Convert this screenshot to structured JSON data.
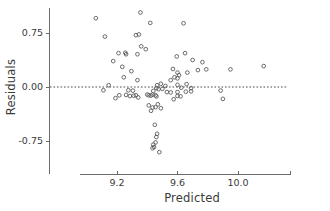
{
  "chart_data": {
    "type": "scatter",
    "title": "",
    "xlabel": "Predicted",
    "ylabel": "Residuals",
    "xlim": [
      9.02,
      10.32
    ],
    "ylim": [
      -1.02,
      1.02
    ],
    "xticks": [
      9.2,
      9.6,
      10.0
    ],
    "xticklabels": [
      "9.2",
      "9.6",
      "10.0"
    ],
    "yticks": [
      0.75,
      0.0,
      -0.75
    ],
    "yticklabels": [
      "0.75",
      "0.00",
      "-0.75"
    ],
    "grid": false,
    "legend": null,
    "reference_lines": [
      {
        "orientation": "horizontal",
        "y": 0.0,
        "style": "dotted"
      }
    ],
    "marker": "open-circle",
    "point_count": 84,
    "points": [
      {
        "x": 9.06,
        "y": 0.955
      },
      {
        "x": 9.12,
        "y": 0.7
      },
      {
        "x": 9.355,
        "y": 1.035
      },
      {
        "x": 9.42,
        "y": 0.89
      },
      {
        "x": 9.325,
        "y": 0.72
      },
      {
        "x": 9.345,
        "y": 0.73
      },
      {
        "x": 9.64,
        "y": 0.885
      },
      {
        "x": 9.36,
        "y": 0.565
      },
      {
        "x": 9.39,
        "y": 0.525
      },
      {
        "x": 9.21,
        "y": 0.47
      },
      {
        "x": 9.255,
        "y": 0.475
      },
      {
        "x": 9.26,
        "y": 0.455
      },
      {
        "x": 9.335,
        "y": 0.455
      },
      {
        "x": 9.595,
        "y": 0.425
      },
      {
        "x": 9.65,
        "y": 0.47
      },
      {
        "x": 9.175,
        "y": 0.36
      },
      {
        "x": 9.7,
        "y": 0.375
      },
      {
        "x": 9.765,
        "y": 0.345
      },
      {
        "x": 9.235,
        "y": 0.28
      },
      {
        "x": 9.295,
        "y": 0.22
      },
      {
        "x": 9.57,
        "y": 0.25
      },
      {
        "x": 9.6,
        "y": 0.2
      },
      {
        "x": 9.61,
        "y": 0.165
      },
      {
        "x": 9.665,
        "y": 0.2
      },
      {
        "x": 9.735,
        "y": 0.235
      },
      {
        "x": 9.79,
        "y": 0.245
      },
      {
        "x": 9.95,
        "y": 0.245
      },
      {
        "x": 10.17,
        "y": 0.29
      },
      {
        "x": 9.245,
        "y": 0.135
      },
      {
        "x": 9.335,
        "y": 0.095
      },
      {
        "x": 9.555,
        "y": 0.095
      },
      {
        "x": 9.58,
        "y": 0.135
      },
      {
        "x": 9.6,
        "y": 0.12
      },
      {
        "x": 9.145,
        "y": 0.025
      },
      {
        "x": 9.465,
        "y": 0.025
      },
      {
        "x": 9.49,
        "y": 0.045
      },
      {
        "x": 9.52,
        "y": 0.015
      },
      {
        "x": 9.6,
        "y": 0.03
      },
      {
        "x": 9.66,
        "y": 0.04
      },
      {
        "x": 9.46,
        "y": -0.015
      },
      {
        "x": 9.475,
        "y": -0.03
      },
      {
        "x": 9.5,
        "y": -0.025
      },
      {
        "x": 9.625,
        "y": -0.01
      },
      {
        "x": 9.69,
        "y": -0.015
      },
      {
        "x": 9.11,
        "y": -0.045
      },
      {
        "x": 9.275,
        "y": -0.045
      },
      {
        "x": 9.305,
        "y": -0.05
      },
      {
        "x": 9.44,
        "y": -0.055
      },
      {
        "x": 9.53,
        "y": -0.07
      },
      {
        "x": 9.555,
        "y": -0.075
      },
      {
        "x": 9.6,
        "y": -0.07
      },
      {
        "x": 9.655,
        "y": -0.065
      },
      {
        "x": 9.69,
        "y": -0.06
      },
      {
        "x": 9.885,
        "y": -0.05
      },
      {
        "x": 9.215,
        "y": -0.115
      },
      {
        "x": 9.26,
        "y": -0.11
      },
      {
        "x": 9.285,
        "y": -0.125
      },
      {
        "x": 9.31,
        "y": -0.12
      },
      {
        "x": 9.325,
        "y": -0.115
      },
      {
        "x": 9.4,
        "y": -0.105
      },
      {
        "x": 9.41,
        "y": -0.115
      },
      {
        "x": 9.425,
        "y": -0.12
      },
      {
        "x": 9.435,
        "y": -0.105
      },
      {
        "x": 9.455,
        "y": -0.115
      },
      {
        "x": 9.46,
        "y": -0.13
      },
      {
        "x": 9.6,
        "y": -0.125
      },
      {
        "x": 9.62,
        "y": -0.13
      },
      {
        "x": 9.19,
        "y": -0.155
      },
      {
        "x": 9.34,
        "y": -0.145
      },
      {
        "x": 9.575,
        "y": -0.17
      },
      {
        "x": 9.9,
        "y": -0.165
      },
      {
        "x": 9.41,
        "y": -0.255
      },
      {
        "x": 9.435,
        "y": -0.285
      },
      {
        "x": 9.47,
        "y": -0.24
      },
      {
        "x": 9.455,
        "y": -0.28
      },
      {
        "x": 9.49,
        "y": -0.295
      },
      {
        "x": 9.425,
        "y": -0.33
      },
      {
        "x": 9.45,
        "y": -0.525
      },
      {
        "x": 9.465,
        "y": -0.65
      },
      {
        "x": 9.46,
        "y": -0.695
      },
      {
        "x": 9.455,
        "y": -0.77
      },
      {
        "x": 9.44,
        "y": -0.8
      },
      {
        "x": 9.445,
        "y": -0.835
      },
      {
        "x": 9.435,
        "y": -0.85
      },
      {
        "x": 9.48,
        "y": -0.905
      }
    ]
  },
  "axes": {
    "x_axis_name": "x-axis",
    "y_axis_name": "y-axis"
  }
}
